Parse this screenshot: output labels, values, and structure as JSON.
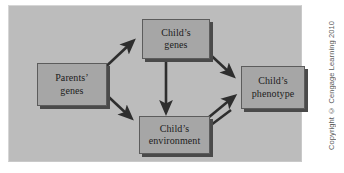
{
  "figure": {
    "kind": "flow-diagram",
    "panel_background": "#bcbcbc",
    "page_background": "#ffffff",
    "node_fill": "#a6a6a6",
    "node_border": "#5c5c5c",
    "node_shadow": "#4a4a4a",
    "arrow_color": "#2e2e2e",
    "text_color": "#1c1c1c"
  },
  "nodes": [
    {
      "id": "parents-genes",
      "label": "Parents’\ngenes"
    },
    {
      "id": "childs-genes",
      "label": "Child’s\ngenes"
    },
    {
      "id": "childs-phenotype",
      "label": "Child’s\nphenotype"
    },
    {
      "id": "childs-environment",
      "label": "Child’s\nenvironment"
    }
  ],
  "edges": [
    {
      "id": "parents-to-genes",
      "from": "parents-genes",
      "to": "childs-genes",
      "direction": "one-way"
    },
    {
      "id": "parents-to-environment",
      "from": "parents-genes",
      "to": "childs-environment",
      "direction": "one-way"
    },
    {
      "id": "genes-to-phenotype",
      "from": "childs-genes",
      "to": "childs-phenotype",
      "direction": "one-way"
    },
    {
      "id": "genes-to-environment",
      "from": "childs-genes",
      "to": "childs-environment",
      "direction": "one-way"
    },
    {
      "id": "environment-to-phenotype",
      "from": "childs-environment",
      "to": "childs-phenotype",
      "direction": "one-way"
    },
    {
      "id": "phenotype-to-environment",
      "from": "childs-phenotype",
      "to": "childs-environment",
      "direction": "one-way"
    }
  ],
  "credit": {
    "text": "Copyright © Cengage Learning 2010"
  }
}
